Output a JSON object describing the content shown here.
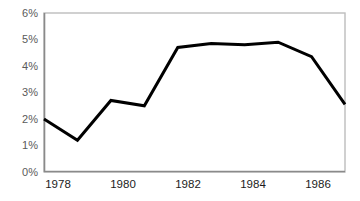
{
  "chart_data": {
    "type": "line",
    "title": "",
    "subtitle": "",
    "xlabel": "",
    "ylabel": "",
    "x": [
      1978,
      1979,
      1980,
      1981,
      1982,
      1983,
      1984,
      1985,
      1986,
      1987
    ],
    "values": [
      2.0,
      1.2,
      2.7,
      2.5,
      4.7,
      4.85,
      4.8,
      4.9,
      4.35,
      2.55
    ],
    "series": [
      {
        "name": "",
        "values": [
          2.0,
          1.2,
          2.7,
          2.5,
          4.7,
          4.85,
          4.8,
          4.9,
          4.35,
          2.55
        ]
      }
    ],
    "ylim": [
      0,
      6
    ],
    "xlim": [
      1978,
      1987
    ],
    "ytick_values": [
      0,
      1,
      2,
      3,
      4,
      5,
      6
    ],
    "ytick_labels": [
      "0%",
      "1%",
      "2%",
      "3%",
      "4%",
      "5%",
      "6%"
    ],
    "xtick_values": [
      1978,
      1980,
      1982,
      1984,
      1986
    ],
    "xtick_labels": [
      "1978",
      "1980",
      "1982",
      "1984",
      "1986"
    ],
    "grid": false,
    "legend": false,
    "legend_position": "none",
    "annotations": [],
    "line_color": "#000000",
    "line_width": 3,
    "frame_color": "#bdbdbd",
    "axis_color": "#8a8a8a",
    "tick_label_color": "#5a5a5a",
    "xtick_label_color": "#1c1c1c",
    "background_color": "#ffffff"
  },
  "plot_geometry": {
    "left": 44,
    "right": 345,
    "top": 13,
    "bottom": 172
  }
}
